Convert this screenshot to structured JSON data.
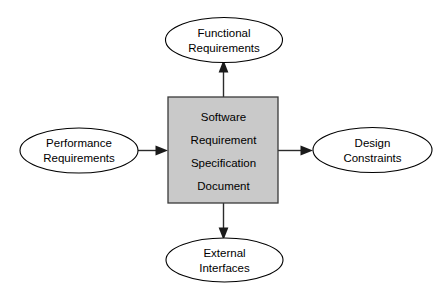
{
  "diagram": {
    "type": "block-diagram",
    "background_color": "#ffffff",
    "center_node": {
      "name": "srs-document",
      "shape": "rectangle",
      "fill_color": "#c9c9c9",
      "border_color": "#3a3a3a",
      "lines": [
        "Software",
        "Requirement",
        "Specification",
        "Document"
      ]
    },
    "nodes": [
      {
        "name": "functional-requirements",
        "shape": "ellipse",
        "position": "top",
        "fill_color": "#ffffff",
        "border_color": "#000000",
        "lines": [
          "Functional",
          "Requirements"
        ]
      },
      {
        "name": "performance-requirements",
        "shape": "ellipse",
        "position": "left",
        "fill_color": "#ffffff",
        "border_color": "#000000",
        "lines": [
          "Performance",
          "Requirements"
        ]
      },
      {
        "name": "design-constraints",
        "shape": "ellipse",
        "position": "right",
        "fill_color": "#ffffff",
        "border_color": "#000000",
        "lines": [
          "Design",
          "Constraints"
        ]
      },
      {
        "name": "external-interfaces",
        "shape": "ellipse",
        "position": "bottom",
        "fill_color": "#ffffff",
        "border_color": "#000000",
        "lines": [
          "External",
          "Interfaces"
        ]
      }
    ],
    "connectors": [
      {
        "name": "arrow-srs-to-functional-requirements",
        "from": "srs-document",
        "to": "functional-requirements",
        "direction": "up",
        "color": "#2b2b2b"
      },
      {
        "name": "arrow-performance-requirements-to-srs",
        "from": "performance-requirements",
        "to": "srs-document",
        "direction": "right",
        "color": "#2b2b2b"
      },
      {
        "name": "arrow-srs-to-design-constraints",
        "from": "srs-document",
        "to": "design-constraints",
        "direction": "right",
        "color": "#2b2b2b"
      },
      {
        "name": "arrow-srs-to-external-interfaces",
        "from": "srs-document",
        "to": "external-interfaces",
        "direction": "down",
        "color": "#2b2b2b"
      }
    ]
  }
}
